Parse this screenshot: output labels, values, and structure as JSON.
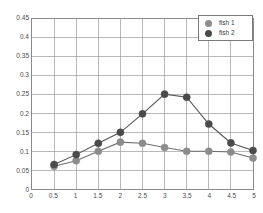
{
  "chart_data": {
    "type": "line",
    "title": "",
    "xlabel": "",
    "ylabel": "",
    "xlim": [
      0,
      5
    ],
    "ylim": [
      0,
      0.45
    ],
    "grid": true,
    "legend_position": "top-right",
    "x": [
      0.5,
      1,
      1.5,
      2,
      2.5,
      3,
      3.5,
      4,
      4.5,
      5
    ],
    "xticks": [
      "0",
      "0.5",
      "1",
      "1.5",
      "2",
      "2.5",
      "3",
      "3.5",
      "4",
      "4.5",
      "5"
    ],
    "xtick_values": [
      0,
      0.5,
      1,
      1.5,
      2,
      2.5,
      3,
      3.5,
      4,
      4.5,
      5
    ],
    "yticks": [
      "0",
      "0.05",
      "0.1",
      "0.15",
      "0.2",
      "0.25",
      "0.3",
      "0.35",
      "0.4",
      "0.45"
    ],
    "ytick_values": [
      0,
      0.05,
      0.1,
      0.15,
      0.2,
      0.25,
      0.3,
      0.35,
      0.4,
      0.45
    ],
    "series": [
      {
        "name": "fish 1",
        "color": "#8c8c8c",
        "line_color": "#6e6e6e",
        "marker": "circle",
        "values": [
          0.06,
          0.075,
          0.1,
          0.124,
          0.121,
          0.11,
          0.1,
          0.1,
          0.098,
          0.082
        ]
      },
      {
        "name": "fish 2",
        "color": "#4a4a4a",
        "line_color": "#555555",
        "marker": "circle",
        "values": [
          0.065,
          0.091,
          0.121,
          0.15,
          0.199,
          0.251,
          0.243,
          0.172,
          0.122,
          0.102
        ]
      }
    ]
  },
  "legend": {
    "entries": [
      {
        "label": "fish 1"
      },
      {
        "label": "fish 2"
      }
    ]
  },
  "style": {
    "grid_color": "#9a9a9a",
    "frame_color": "#8a8a8a",
    "background": "#ffffff"
  }
}
